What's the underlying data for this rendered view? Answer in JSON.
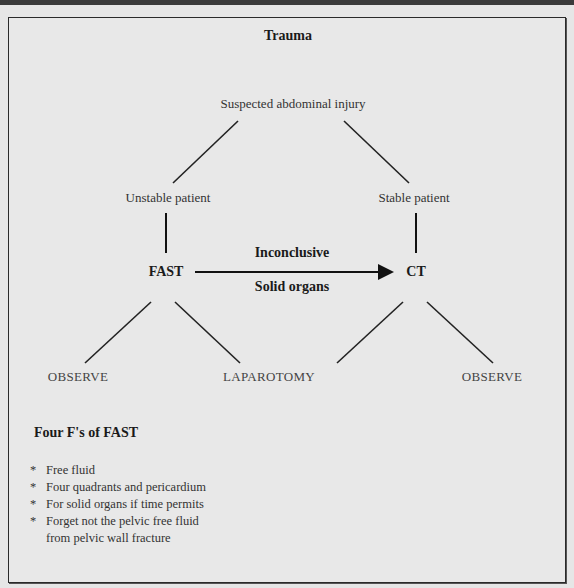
{
  "diagram": {
    "title": "Trauma",
    "root": "Suspected abdominal injury",
    "branches": {
      "left": "Unstable patient",
      "right": "Stable patient"
    },
    "tests": {
      "left": "FAST",
      "right": "CT"
    },
    "arrow": {
      "label_top": "Inconclusive",
      "label_bottom": "Solid organs"
    },
    "outcomes": [
      "OBSERVE",
      "LAPAROTOMY",
      "OBSERVE"
    ]
  },
  "notes": {
    "title": "Four F's of FAST",
    "bullet": "*",
    "items": [
      "Free fluid",
      "Four quadrants and pericardium",
      "For solid organs if time permits",
      "Forget not the pelvic free fluid"
    ],
    "continuation": "from pelvic wall fracture"
  }
}
